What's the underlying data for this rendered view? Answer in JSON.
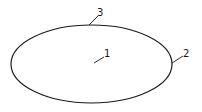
{
  "diagram": {
    "shape": "ellipse",
    "stroke_color": "#1a1a1a",
    "labels": [
      {
        "id": "label-1",
        "text": "1",
        "refers_to": "interior"
      },
      {
        "id": "label-2",
        "text": "2",
        "refers_to": "right-edge"
      },
      {
        "id": "label-3",
        "text": "3",
        "refers_to": "top-edge"
      }
    ]
  }
}
